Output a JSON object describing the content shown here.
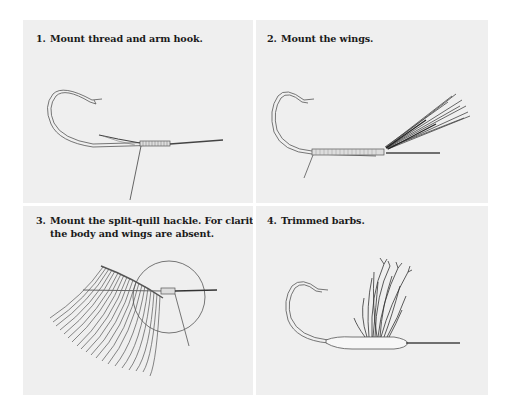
{
  "figure": {
    "panels": [
      {
        "number": "1.",
        "caption": "Mount thread and arm hook.",
        "caption_line2": ""
      },
      {
        "number": "2.",
        "caption": "Mount the wings.",
        "caption_line2": ""
      },
      {
        "number": "3.",
        "caption": "Mount the split-quill hackle. For clarity,",
        "caption_line2": "the body and wings are absent."
      },
      {
        "number": "4.",
        "caption": "Trimmed barbs.",
        "caption_line2": ""
      }
    ]
  },
  "colors": {
    "background": "#ffffff",
    "panel": "#efefef",
    "ink": "#1a1a1a",
    "line": "#555555"
  }
}
